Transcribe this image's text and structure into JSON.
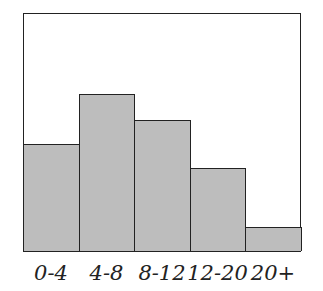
{
  "chart_data": {
    "type": "bar",
    "title": "",
    "xlabel": "",
    "ylabel": "",
    "categories": [
      "0-4",
      "4-8",
      "8-12",
      "12-20",
      "20+"
    ],
    "values": [
      45,
      66,
      55,
      35,
      10
    ],
    "ylim": [
      0,
      100
    ],
    "grid": false,
    "legend": null,
    "bar_color": "#bdbdbd"
  }
}
